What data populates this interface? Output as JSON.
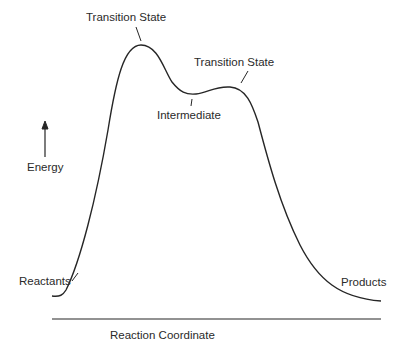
{
  "diagram": {
    "type": "energy-profile",
    "labels": {
      "ts1": "Transition State",
      "ts2": "Transition State",
      "intermediate": "Intermediate",
      "energy": "Energy",
      "reactants": "Reactants",
      "products": "Products",
      "x_axis": "Reaction Coordinate"
    },
    "colors": {
      "stroke": "#262626",
      "text": "#2a2a2a",
      "background": "#ffffff"
    },
    "points": {
      "reactants": [
        52,
        296
      ],
      "transition_state_1": [
        141,
        45
      ],
      "intermediate": [
        192,
        94
      ],
      "transition_state_2": [
        230,
        87
      ],
      "products": [
        381,
        301
      ]
    }
  }
}
